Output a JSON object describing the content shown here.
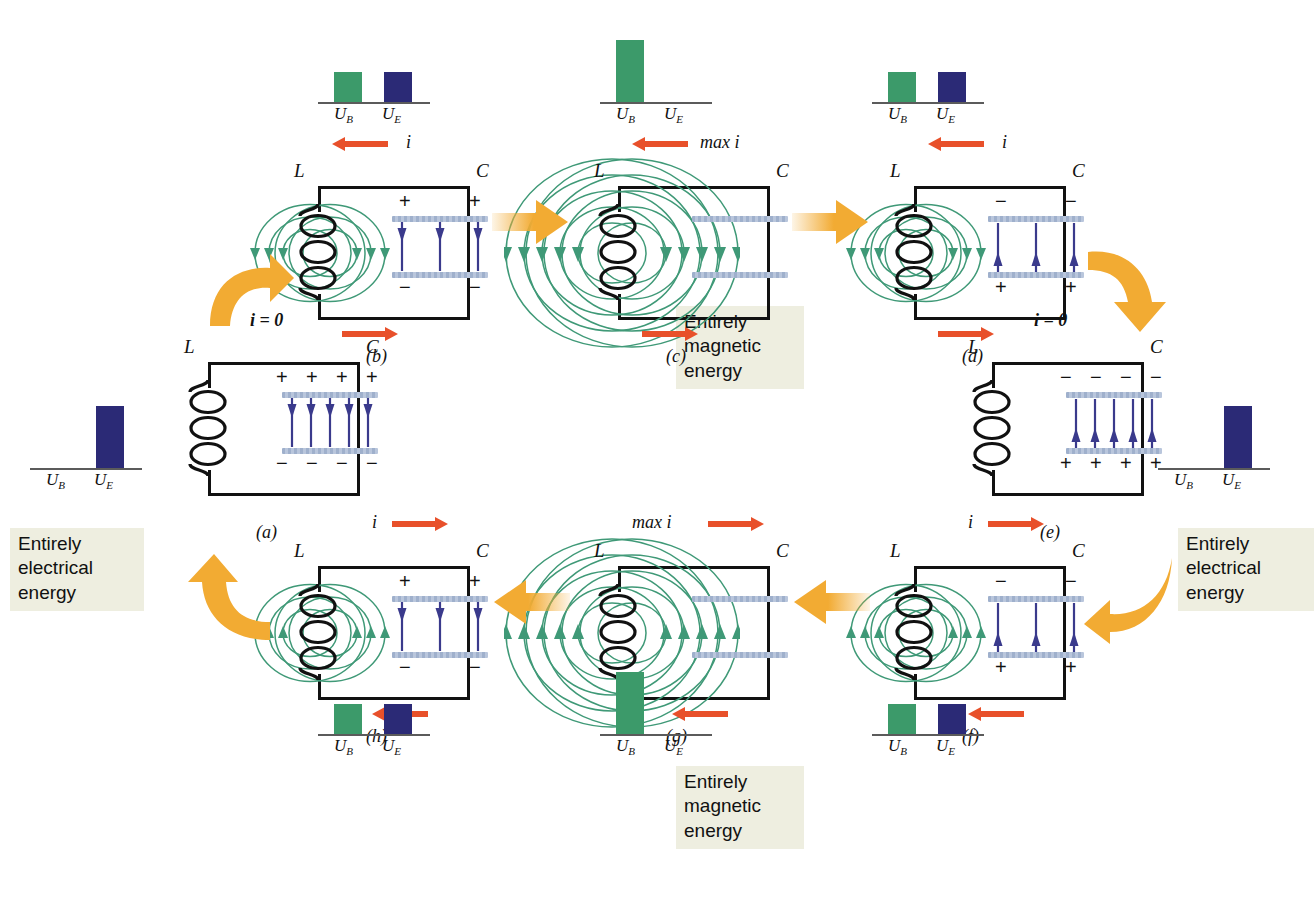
{
  "figure": {
    "colors": {
      "energy_magnetic_bar": "#3c9a6a",
      "energy_electric_bar": "#2b2a76",
      "current_arrow": "#e8502a",
      "transition_arrow": "#f2ab33",
      "b_field_line": "#3f9977",
      "e_field_arrow": "#3a3a8c",
      "capacitor_plate": "#9fb0cc",
      "wire": "#111111",
      "note_background": "#eeeee0"
    },
    "axis_labels": {
      "magnetic": "U",
      "magnetic_sub": "B",
      "electric": "U",
      "electric_sub": "E"
    }
  },
  "notes": [
    {
      "id": "note-electrical-left",
      "lines": [
        "Entirely",
        "electrical",
        "energy"
      ]
    },
    {
      "id": "note-magnetic-top",
      "lines": [
        "Entirely",
        "magnetic",
        "energy"
      ]
    },
    {
      "id": "note-electrical-right",
      "lines": [
        "Entirely",
        "electrical",
        "energy"
      ]
    },
    {
      "id": "note-magnetic-bottom",
      "lines": [
        "Entirely",
        "magnetic",
        "energy"
      ]
    }
  ],
  "panels": [
    {
      "id": "a",
      "label": "(a)",
      "current_label": "i = 0",
      "current_top_dir": "none",
      "current_bottom_dir": "none",
      "b_field": "none",
      "cap_charge": "max-positive-top",
      "cap_top_signs": [
        "+",
        "+",
        "+",
        "+"
      ],
      "cap_bottom_signs": [
        "−",
        "−",
        "−",
        "−"
      ],
      "e_arrows": 5,
      "e_arrow_dir": "down",
      "chart": {
        "ub": 0,
        "ue": 62
      }
    },
    {
      "id": "b",
      "label": "(b)",
      "current_label": "i",
      "current_top_dir": "left",
      "current_bottom_dir": "right",
      "b_field": "small",
      "cap_charge": "partial-positive-top",
      "cap_top_signs": [
        "+",
        "+"
      ],
      "cap_bottom_signs": [
        "−",
        "−"
      ],
      "e_arrows": 3,
      "e_arrow_dir": "down",
      "chart": {
        "ub": 30,
        "ue": 30
      }
    },
    {
      "id": "c",
      "label": "(c)",
      "current_label": "max i",
      "current_top_dir": "left",
      "current_bottom_dir": "right",
      "b_field": "large",
      "cap_charge": "none",
      "cap_top_signs": [],
      "cap_bottom_signs": [],
      "e_arrows": 0,
      "e_arrow_dir": "none",
      "chart": {
        "ub": 62,
        "ue": 0
      }
    },
    {
      "id": "d",
      "label": "(d)",
      "current_label": "i",
      "current_top_dir": "left",
      "current_bottom_dir": "right",
      "b_field": "small",
      "cap_charge": "partial-negative-top",
      "cap_top_signs": [
        "−",
        "−"
      ],
      "cap_bottom_signs": [
        "+",
        "+"
      ],
      "e_arrows": 3,
      "e_arrow_dir": "up",
      "chart": {
        "ub": 30,
        "ue": 30
      }
    },
    {
      "id": "e",
      "label": "(e)",
      "current_label": "i = 0",
      "current_top_dir": "none",
      "current_bottom_dir": "none",
      "b_field": "none",
      "cap_charge": "max-negative-top",
      "cap_top_signs": [
        "−",
        "−",
        "−",
        "−"
      ],
      "cap_bottom_signs": [
        "+",
        "+",
        "+",
        "+"
      ],
      "e_arrows": 5,
      "e_arrow_dir": "up",
      "chart": {
        "ub": 0,
        "ue": 62
      }
    },
    {
      "id": "f",
      "label": "(f)",
      "current_label": "i",
      "current_top_dir": "right",
      "current_bottom_dir": "left",
      "b_field": "small-up",
      "cap_charge": "partial-negative-top",
      "cap_top_signs": [
        "−",
        "−"
      ],
      "cap_bottom_signs": [
        "+",
        "+"
      ],
      "e_arrows": 3,
      "e_arrow_dir": "up",
      "chart": {
        "ub": 30,
        "ue": 30
      }
    },
    {
      "id": "g",
      "label": "(g)",
      "current_label": "max i",
      "current_top_dir": "right",
      "current_bottom_dir": "left",
      "b_field": "large-up",
      "cap_charge": "none",
      "cap_top_signs": [],
      "cap_bottom_signs": [],
      "e_arrows": 0,
      "e_arrow_dir": "none",
      "chart": {
        "ub": 62,
        "ue": 0
      }
    },
    {
      "id": "h",
      "label": "(h)",
      "current_label": "i",
      "current_top_dir": "right",
      "current_bottom_dir": "left",
      "b_field": "small-up",
      "cap_charge": "partial-positive-top",
      "cap_top_signs": [
        "+",
        "+"
      ],
      "cap_bottom_signs": [
        "−",
        "−"
      ],
      "e_arrows": 3,
      "e_arrow_dir": "down",
      "chart": {
        "ub": 30,
        "ue": 30
      }
    }
  ],
  "component_labels": {
    "inductor": "L",
    "capacitor": "C"
  },
  "transitions": [
    {
      "id": "a-to-b",
      "shape": "curved",
      "direction": "up-right"
    },
    {
      "id": "b-to-c",
      "shape": "straight",
      "direction": "right"
    },
    {
      "id": "c-to-d",
      "shape": "straight",
      "direction": "right"
    },
    {
      "id": "d-to-e",
      "shape": "curved",
      "direction": "down-right"
    },
    {
      "id": "e-to-f",
      "shape": "curved",
      "direction": "down-left"
    },
    {
      "id": "f-to-g",
      "shape": "straight",
      "direction": "left"
    },
    {
      "id": "g-to-h",
      "shape": "straight",
      "direction": "left"
    },
    {
      "id": "h-to-a",
      "shape": "curved",
      "direction": "up-left"
    }
  ]
}
